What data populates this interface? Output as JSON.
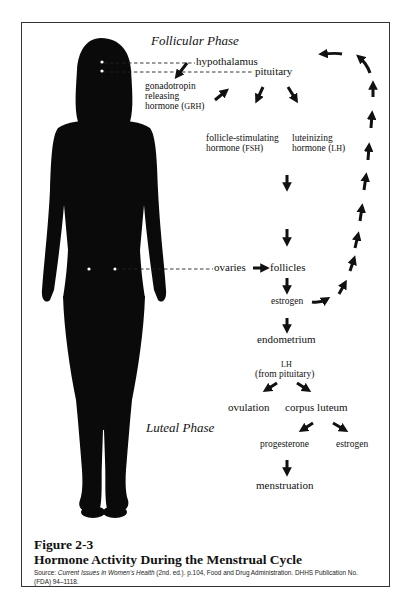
{
  "figure": {
    "phases": {
      "follicular": "Follicular Phase",
      "luteal": "Luteal Phase"
    },
    "labels": {
      "hypothalamus": "hypothalamus",
      "pituitary": "pituitary",
      "grh_1": "gonadotropin",
      "grh_2": "releasing",
      "grh_3": "hormone (",
      "grh_abbr": "GRH",
      "grh_close": ")",
      "fsh_1": "follicle-stimulating",
      "fsh_2": "hormone (",
      "fsh_abbr": "FSH",
      "fsh_close": ")",
      "lh_1": "luteinizing",
      "lh_2": "hormone (",
      "lh_abbr": "LH",
      "lh_close": ")",
      "ovaries": "ovaries",
      "follicles": "follicles",
      "estrogen": "estrogen",
      "endometrium": "endometrium",
      "lh_top": "LH",
      "lh_from": "(from pituitary)",
      "ovulation": "ovulation",
      "corpus_luteum": "corpus luteum",
      "progesterone": "progesterone",
      "estrogen_2": "estrogen",
      "menstruation": "menstruation"
    }
  },
  "caption": {
    "number": "Figure 2-3",
    "title": "Hormone Activity During the Menstrual Cycle",
    "source_label": "Source: ",
    "source_title": "Current Issues in Women's Health",
    "source_rest_1": " (2nd. ed.). p.104, Food and Drug Administration. DHHS Publication No.",
    "source_rest_2": "(FDA) 94–1118."
  }
}
